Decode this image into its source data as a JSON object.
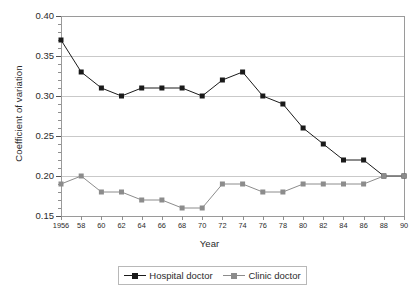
{
  "chart_data": {
    "type": "line",
    "title": "",
    "xlabel": "Year",
    "ylabel": "Coefficient of variation",
    "xlim": [
      1956,
      1990
    ],
    "ylim": [
      0.15,
      0.4
    ],
    "grid": true,
    "legend_position": "bottom",
    "x": [
      1956,
      1958,
      1960,
      1962,
      1964,
      1966,
      1968,
      1970,
      1972,
      1974,
      1976,
      1978,
      1980,
      1982,
      1984,
      1986,
      1988,
      1990
    ],
    "xtick_labels": [
      "1956",
      "58",
      "60",
      "62",
      "64",
      "66",
      "68",
      "70",
      "72",
      "74",
      "76",
      "78",
      "80",
      "82",
      "84",
      "86",
      "88",
      "90"
    ],
    "ytick_labels": [
      "0.40",
      "0.35",
      "0.30",
      "0.25",
      "0.20",
      "0.15"
    ],
    "ytick_values": [
      0.4,
      0.35,
      0.3,
      0.25,
      0.2,
      0.15
    ],
    "series": [
      {
        "name": "Hospital doctor",
        "color": "#1a1a1a",
        "marker": "square",
        "values": [
          0.37,
          0.33,
          0.31,
          0.3,
          0.31,
          0.31,
          0.31,
          0.3,
          0.32,
          0.33,
          0.3,
          0.29,
          0.26,
          0.24,
          0.22,
          0.22,
          0.2,
          0.2
        ]
      },
      {
        "name": "Clinic doctor",
        "color": "#8c8c8c",
        "marker": "square",
        "values": [
          0.19,
          0.2,
          0.18,
          0.18,
          0.17,
          0.17,
          0.16,
          0.16,
          0.19,
          0.19,
          0.18,
          0.18,
          0.19,
          0.19,
          0.19,
          0.19,
          0.2,
          0.2
        ]
      }
    ]
  },
  "legend": {
    "entries": [
      {
        "label": "Hospital doctor",
        "color": "#1a1a1a"
      },
      {
        "label": "Clinic doctor",
        "color": "#8c8c8c"
      }
    ]
  }
}
